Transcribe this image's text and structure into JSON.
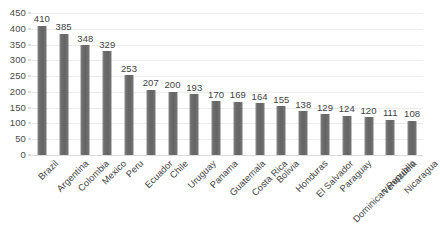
{
  "chart_data": {
    "type": "bar",
    "title": "",
    "subtitle": "",
    "xlabel": "",
    "ylabel": "",
    "ylim": [
      0,
      450
    ],
    "ytick_step": 50,
    "yticks": [
      450,
      400,
      350,
      300,
      250,
      200,
      150,
      100,
      50,
      0
    ],
    "grid": true,
    "grid_axis": "y",
    "legend": false,
    "legend_position": "none",
    "data_labels": true,
    "bar_color": "#6d6d6e",
    "gridline_color": "#ececed",
    "text_color": "#434343",
    "background_color": "#ffffff",
    "categories": [
      "Brazil",
      "Argentina",
      "Colombia",
      "Mexico",
      "Peru",
      "Ecuador",
      "Chile",
      "Uruguay",
      "Panama",
      "Guatemala",
      "Costa Rica",
      "Bolivia",
      "Honduras",
      "El Salvador",
      "Paraguay",
      "Dominican Republic",
      "Venezuela",
      "Nicaragua"
    ],
    "values": [
      410,
      385,
      348,
      329,
      253,
      207,
      200,
      193,
      170,
      169,
      164,
      155,
      138,
      129,
      124,
      120,
      111,
      108
    ],
    "series": [
      {
        "name": "",
        "values": [
          410,
          385,
          348,
          329,
          253,
          207,
          200,
          193,
          170,
          169,
          164,
          155,
          138,
          129,
          124,
          120,
          111,
          108
        ]
      }
    ]
  }
}
